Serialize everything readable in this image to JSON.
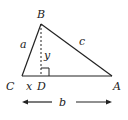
{
  "diagram": {
    "type": "right-triangle-altitude",
    "vertices": {
      "B": "B",
      "C": "C",
      "D": "D",
      "A": "A"
    },
    "sides": {
      "a": "a",
      "c": "c",
      "b": "b",
      "x": "x",
      "y": "y"
    },
    "colors": {
      "stroke": "#222222",
      "background": "#ffffff"
    }
  }
}
